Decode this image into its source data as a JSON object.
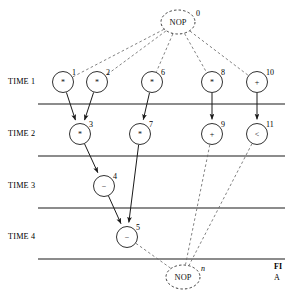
{
  "figure": {
    "type": "dependency-graph-schedule",
    "caption_line1": "FI",
    "caption_line2": "A"
  },
  "colors": {
    "node_stroke": "#1a1a1a",
    "edge_solid": "#1a1a1a",
    "edge_dashed": "#6b6b6b",
    "time_line": "#8c8c8c",
    "text": "#000000",
    "background": "#ffffff"
  },
  "time_steps": [
    {
      "label": "TIME 1",
      "x": 8,
      "y": 77
    },
    {
      "label": "TIME 2",
      "x": 8,
      "y": 129
    },
    {
      "label": "TIME 3",
      "x": 8,
      "y": 181
    },
    {
      "label": "TIME 4",
      "x": 8,
      "y": 232
    }
  ],
  "time_lines": [
    {
      "x1": 38,
      "y1": 104,
      "x2": 285,
      "y2": 104
    },
    {
      "x1": 38,
      "y1": 156,
      "x2": 285,
      "y2": 156
    },
    {
      "x1": 38,
      "y1": 208,
      "x2": 285,
      "y2": 208
    },
    {
      "x1": 38,
      "y1": 259,
      "x2": 285,
      "y2": 259
    }
  ],
  "nodes": [
    {
      "id": "0",
      "op": "NOP",
      "kind": "nop",
      "cx": 178,
      "cy": 22,
      "r": 15.5,
      "rx": 17,
      "ry": 12,
      "label_dx": 18,
      "label_dy": -6,
      "label_italic": false,
      "time": "source"
    },
    {
      "id": "1",
      "op": "*",
      "kind": "op",
      "cx": 63,
      "cy": 82,
      "r": 10.5,
      "label_dx": 9,
      "label_dy": -7,
      "label_italic": false,
      "time": "TIME 1"
    },
    {
      "id": "2",
      "op": "*",
      "kind": "op",
      "cx": 97,
      "cy": 82,
      "r": 10.5,
      "label_dx": 9,
      "label_dy": -7,
      "label_italic": false,
      "time": "TIME 1"
    },
    {
      "id": "6",
      "op": "*",
      "kind": "op",
      "cx": 152,
      "cy": 82,
      "r": 10.5,
      "label_dx": 9,
      "label_dy": -7,
      "label_italic": false,
      "time": "TIME 1"
    },
    {
      "id": "8",
      "op": "*",
      "kind": "op",
      "cx": 212,
      "cy": 82,
      "r": 10.5,
      "label_dx": 9,
      "label_dy": -7,
      "label_italic": false,
      "time": "TIME 1"
    },
    {
      "id": "10",
      "op": "+",
      "kind": "op",
      "cx": 257,
      "cy": 82,
      "r": 10.5,
      "label_dx": 9,
      "label_dy": -7,
      "label_italic": false,
      "time": "TIME 1"
    },
    {
      "id": "3",
      "op": "*",
      "kind": "op",
      "cx": 80,
      "cy": 134,
      "r": 10.5,
      "label_dx": 9,
      "label_dy": -7,
      "label_italic": false,
      "time": "TIME 2"
    },
    {
      "id": "7",
      "op": "*",
      "kind": "op",
      "cx": 140,
      "cy": 134,
      "r": 10.5,
      "label_dx": 9,
      "label_dy": -7,
      "label_italic": false,
      "time": "TIME 2"
    },
    {
      "id": "9",
      "op": "+",
      "kind": "op",
      "cx": 212,
      "cy": 134,
      "r": 10.5,
      "label_dx": 9,
      "label_dy": -7,
      "label_italic": false,
      "time": "TIME 2"
    },
    {
      "id": "11",
      "op": "<",
      "kind": "op",
      "cx": 257,
      "cy": 134,
      "r": 10.5,
      "label_dx": 9,
      "label_dy": -7,
      "label_italic": false,
      "time": "TIME 2"
    },
    {
      "id": "4",
      "op": "−",
      "kind": "op",
      "cx": 104,
      "cy": 186,
      "r": 10.5,
      "label_dx": 9,
      "label_dy": -7,
      "label_italic": false,
      "time": "TIME 3"
    },
    {
      "id": "5",
      "op": "−",
      "kind": "op",
      "cx": 127,
      "cy": 237,
      "r": 10.5,
      "label_dx": 9,
      "label_dy": -7,
      "label_italic": false,
      "time": "TIME 4"
    },
    {
      "id": "n",
      "op": "NOP",
      "kind": "nop",
      "cx": 183,
      "cy": 277,
      "r": 15.5,
      "rx": 17,
      "ry": 12,
      "label_dx": 18,
      "label_dy": -6,
      "label_italic": true,
      "time": "sink"
    }
  ],
  "edges": [
    {
      "from": "0",
      "to": "1",
      "style": "dashed",
      "arrow": false
    },
    {
      "from": "0",
      "to": "2",
      "style": "dashed",
      "arrow": false
    },
    {
      "from": "0",
      "to": "6",
      "style": "dashed",
      "arrow": false
    },
    {
      "from": "0",
      "to": "8",
      "style": "dashed",
      "arrow": false
    },
    {
      "from": "0",
      "to": "10",
      "style": "dashed",
      "arrow": false
    },
    {
      "from": "1",
      "to": "3",
      "style": "solid",
      "arrow": true
    },
    {
      "from": "2",
      "to": "3",
      "style": "solid",
      "arrow": true
    },
    {
      "from": "6",
      "to": "7",
      "style": "solid",
      "arrow": true
    },
    {
      "from": "8",
      "to": "9",
      "style": "solid",
      "arrow": true
    },
    {
      "from": "10",
      "to": "11",
      "style": "solid",
      "arrow": true
    },
    {
      "from": "3",
      "to": "4",
      "style": "solid",
      "arrow": true
    },
    {
      "from": "4",
      "to": "5",
      "style": "solid",
      "arrow": true
    },
    {
      "from": "7",
      "to": "5",
      "style": "solid",
      "arrow": true
    },
    {
      "from": "5",
      "to": "n",
      "style": "dashed",
      "arrow": false
    },
    {
      "from": "9",
      "to": "n",
      "style": "dashed",
      "arrow": false
    },
    {
      "from": "11",
      "to": "n",
      "style": "dashed",
      "arrow": false
    }
  ]
}
